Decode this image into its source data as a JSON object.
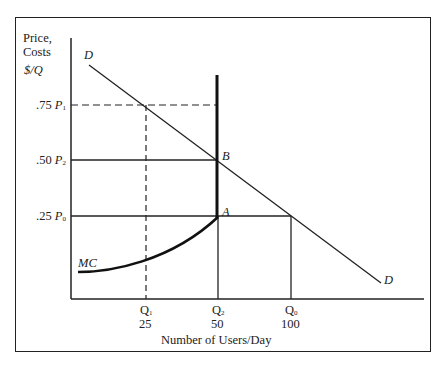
{
  "diagram": {
    "y_axis_label": [
      "Price,",
      "Costs",
      "$/Q"
    ],
    "x_axis_label": "Number of Users/Day",
    "price_ticks": [
      {
        "value": ".75",
        "symbol": "P",
        "sub": "1"
      },
      {
        "value": ".50",
        "symbol": "P",
        "sub": "2"
      },
      {
        "value": ".25",
        "symbol": "P",
        "sub": "0"
      }
    ],
    "quantity_ticks": [
      {
        "symbol": "Q",
        "sub": "1",
        "value": "25"
      },
      {
        "symbol": "Q",
        "sub": "2",
        "value": "50"
      },
      {
        "symbol": "Q",
        "sub": "0",
        "value": "100"
      }
    ],
    "curves": {
      "demand_label_top": "D",
      "demand_label_bottom": "D",
      "mc_label": "MC"
    },
    "points": {
      "A": "A",
      "B": "B"
    }
  }
}
